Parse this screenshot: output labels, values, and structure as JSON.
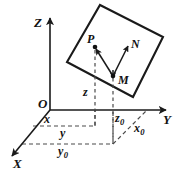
{
  "figure": {
    "background_color": "#ffffff",
    "line_color": "#1a1a1a",
    "dash_color": "#4a4a4a",
    "axes": {
      "z_label": "Z",
      "y_label": "Y",
      "x_label": "X",
      "origin_label": "O"
    },
    "points": {
      "p_label": "P",
      "m_label": "M",
      "n_label": "N"
    },
    "coords": {
      "z_label": "z",
      "x_label": "x",
      "y_label": "y",
      "z0_base": "z",
      "z0_sub": "0",
      "x0_base": "x",
      "x0_sub": "0",
      "y0_base": "y",
      "y0_sub": "0"
    }
  }
}
